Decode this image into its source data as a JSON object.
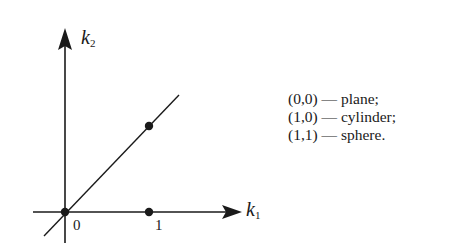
{
  "diagram": {
    "axes": {
      "x_label": "k",
      "x_subscript": "1",
      "y_label": "k",
      "y_subscript": "2"
    },
    "tick_labels": {
      "origin": "0",
      "one": "1"
    },
    "points": [
      {
        "name": "plane",
        "coords": [
          0,
          0
        ]
      },
      {
        "name": "cylinder",
        "coords": [
          1,
          0
        ]
      },
      {
        "name": "sphere",
        "coords": [
          1,
          1
        ]
      }
    ],
    "line": "k2 = k1 diagonal through origin",
    "legend": [
      "(0,0) — plane;",
      "(1,0) — cylinder;",
      "(1,1) — sphere."
    ],
    "colors": {
      "ink": "#1a1a1a",
      "background": "#ffffff"
    }
  }
}
